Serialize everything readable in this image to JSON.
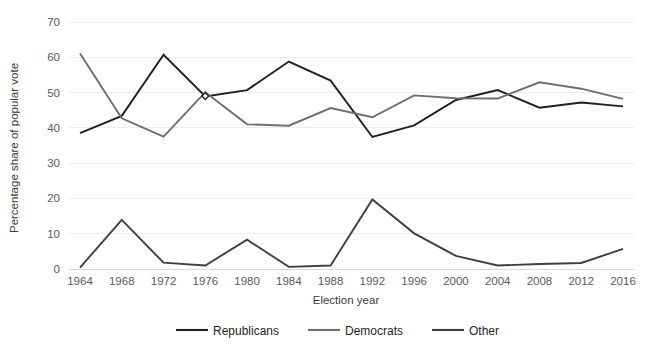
{
  "chart_data": {
    "type": "line",
    "title": "",
    "xlabel": "Election year",
    "ylabel": "Percentage share of popular vote",
    "categories": [
      "1964",
      "1968",
      "1972",
      "1976",
      "1980",
      "1984",
      "1988",
      "1992",
      "1996",
      "2000",
      "2004",
      "2008",
      "2012",
      "2016"
    ],
    "x_tick_labels": [
      "1964",
      "1968",
      "1972",
      "1976",
      "1980",
      "1984",
      "1988",
      "1992",
      "1996",
      "2000",
      "2004",
      "2008",
      "2012",
      "2016"
    ],
    "y_tick_labels": [
      "0",
      "10",
      "20",
      "30",
      "40",
      "50",
      "60",
      "70"
    ],
    "y_ticks": [
      0,
      10,
      20,
      30,
      40,
      50,
      60,
      70
    ],
    "ylim": [
      0,
      70
    ],
    "grid": "horizontal",
    "legend_position": "bottom",
    "series": [
      {
        "name": "Republicans",
        "color": "#231f20",
        "values": [
          38.5,
          43.4,
          60.7,
          48.9,
          50.7,
          58.8,
          53.4,
          37.4,
          40.7,
          47.9,
          50.7,
          45.7,
          47.2,
          46.1
        ]
      },
      {
        "name": "Democrats",
        "color": "#6d6e71",
        "values": [
          61.1,
          42.7,
          37.5,
          50.1,
          41.0,
          40.6,
          45.6,
          43.0,
          49.2,
          48.4,
          48.3,
          52.9,
          51.1,
          48.2
        ]
      },
      {
        "name": "Other",
        "color": "#3f3f41",
        "values": [
          0.4,
          13.9,
          1.8,
          1.0,
          8.3,
          0.6,
          1.0,
          19.7,
          10.1,
          3.7,
          1.0,
          1.4,
          1.7,
          5.7
        ]
      }
    ],
    "markers": [
      {
        "series": "crossover",
        "x_label": "1976",
        "value": 49.0,
        "shape": "diamond"
      }
    ]
  },
  "legend": {
    "items": [
      {
        "label": "Republicans"
      },
      {
        "label": "Democrats"
      },
      {
        "label": "Other"
      }
    ]
  },
  "axes": {
    "x_title": "Election year",
    "y_title": "Percentage share of popular vote"
  }
}
